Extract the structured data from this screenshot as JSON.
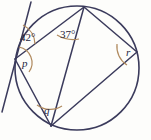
{
  "figure": {
    "shape_name": "circle-with-inscribed-angles",
    "colors": {
      "stroke": "#3b3b5c",
      "arc_marker": "#b08a5e",
      "label_text": "#25253f",
      "background": "#fdfdfb"
    },
    "circle": {
      "name": "main-circle",
      "cx": 77,
      "cy": 68,
      "r": 62
    },
    "vertices": [
      {
        "id": "top",
        "name": "vertex-top",
        "x": 84,
        "y": 7
      },
      {
        "id": "left",
        "name": "vertex-left-p",
        "x": 15,
        "y": 59
      },
      {
        "id": "bottom",
        "name": "vertex-bottom-q",
        "x": 51,
        "y": 126
      },
      {
        "id": "right",
        "name": "vertex-right-r",
        "x": 137,
        "y": 52
      }
    ],
    "chords": [
      {
        "name": "chord-left-to-top",
        "x1": 15,
        "y1": 59,
        "x2": 84,
        "y2": 7
      },
      {
        "name": "chord-top-to-right",
        "x1": 84,
        "y1": 7,
        "x2": 137,
        "y2": 52
      },
      {
        "name": "chord-top-to-bottom",
        "x1": 84,
        "y1": 7,
        "x2": 51,
        "y2": 126
      },
      {
        "name": "chord-left-to-bottom",
        "x1": 15,
        "y1": 59,
        "x2": 51,
        "y2": 126
      },
      {
        "name": "chord-right-to-bottom",
        "x1": 137,
        "y1": 52,
        "x2": 51,
        "y2": 126
      }
    ],
    "tangent": {
      "name": "tangent-line-at-p",
      "x1": 31,
      "y1": 2,
      "x2": 2,
      "y2": 112
    },
    "angles": [
      {
        "id": "a42",
        "name": "angle-label-42",
        "text": "42°",
        "label_x": 20,
        "label_y": 41,
        "marker_path": "M 23 25 A 22 22 0 0 1 35 44",
        "marker_name": "angle-arc-42"
      },
      {
        "id": "a37",
        "name": "angle-label-37",
        "text": "37°",
        "label_x": 60,
        "label_y": 38,
        "marker_path": "M 57 35 A 32 32 0 0 0 79 39",
        "marker_name": "angle-arc-37"
      },
      {
        "id": "p",
        "name": "angle-label-p",
        "text": "p",
        "label_x": 22,
        "label_y": 67,
        "marker_path": "M 19 47 A 16 16 0 0 1 29 72",
        "marker_name": "angle-arc-p"
      },
      {
        "id": "q",
        "name": "angle-label-q",
        "text": "q",
        "label_x": 44,
        "label_y": 114,
        "marker_path": "M 37 105 A 22 22 0 0 0 62 106",
        "marker_name": "angle-arc-q"
      },
      {
        "id": "r",
        "name": "angle-label-r",
        "text": "r",
        "label_x": 126,
        "label_y": 56,
        "marker_path": "M 117 44 A 22 22 0 0 0 127 65",
        "marker_name": "angle-arc-r"
      }
    ]
  }
}
